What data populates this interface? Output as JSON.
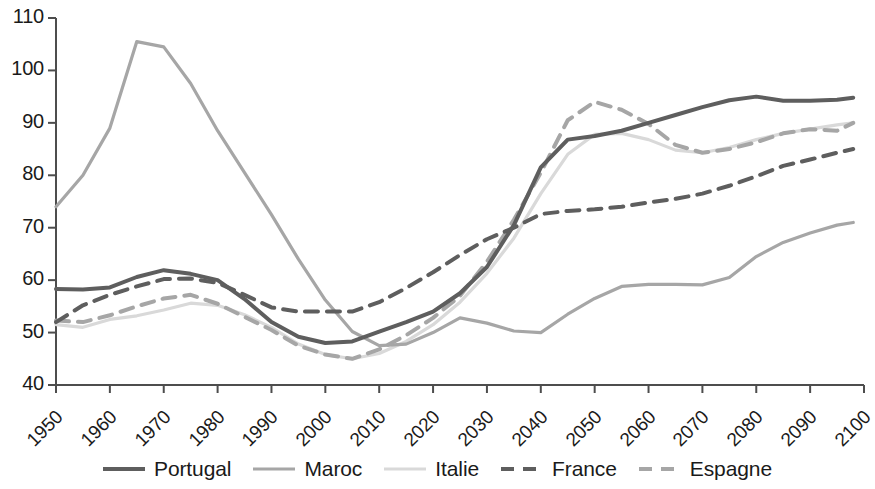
{
  "chart_data": {
    "type": "line",
    "title": "",
    "subtitle": "",
    "xlabel": "",
    "ylabel": "",
    "xlim": [
      1950,
      2100
    ],
    "ylim": [
      40,
      110
    ],
    "grid": false,
    "legend_position": "bottom",
    "x_ticks": [
      "1950",
      "1960",
      "1970",
      "1980",
      "1990",
      "2000",
      "2010",
      "2020",
      "2030",
      "2040",
      "2050",
      "2060",
      "2070",
      "2080",
      "2090",
      "2100"
    ],
    "y_ticks": [
      "40",
      "50",
      "60",
      "70",
      "80",
      "90",
      "100",
      "110"
    ],
    "x": [
      1950,
      1955,
      1960,
      1965,
      1970,
      1975,
      1980,
      1985,
      1990,
      1995,
      2000,
      2005,
      2010,
      2015,
      2020,
      2025,
      2030,
      2035,
      2040,
      2045,
      2050,
      2055,
      2060,
      2065,
      2070,
      2075,
      2080,
      2085,
      2090,
      2095,
      2098
    ],
    "series": [
      {
        "name": "Portugal",
        "color": "#5e5e5e",
        "style": "solid",
        "width": 4.0,
        "values": [
          58.3,
          58.2,
          58.6,
          60.6,
          61.9,
          61.2,
          60.0,
          56.4,
          52.0,
          49.2,
          48.0,
          48.3,
          50.2,
          52.0,
          54.0,
          57.5,
          62.5,
          70.5,
          81.5,
          86.8,
          87.5,
          88.5,
          90.0,
          91.5,
          93.0,
          94.3,
          95.0,
          94.2,
          94.2,
          94.4,
          94.8
        ]
      },
      {
        "name": "Maroc",
        "color": "#a6a6a6",
        "style": "solid",
        "width": 3.2,
        "values": [
          74.0,
          80.0,
          89.0,
          105.5,
          104.5,
          97.5,
          88.5,
          80.5,
          72.5,
          64.0,
          56.2,
          50.2,
          47.5,
          47.8,
          50.0,
          52.8,
          51.8,
          50.3,
          50.0,
          53.5,
          56.5,
          58.8,
          59.2,
          59.2,
          59.1,
          60.5,
          64.5,
          67.2,
          69.0,
          70.5,
          71.0
        ]
      },
      {
        "name": "Italie",
        "color": "#d9d9d9",
        "style": "solid",
        "width": 3.2,
        "values": [
          51.5,
          51.0,
          52.5,
          53.2,
          54.3,
          55.6,
          55.2,
          53.4,
          51.0,
          47.8,
          45.8,
          45.0,
          46.0,
          48.3,
          51.5,
          55.8,
          61.3,
          68.0,
          76.5,
          84.0,
          87.8,
          88.0,
          86.8,
          84.8,
          84.3,
          85.3,
          86.8,
          88.0,
          88.8,
          89.6,
          90.0
        ]
      },
      {
        "name": "France",
        "color": "#5e5e5e",
        "style": "dashed",
        "width": 4.0,
        "values": [
          52.0,
          55.2,
          57.2,
          58.8,
          60.2,
          60.3,
          59.5,
          57.2,
          54.8,
          54.0,
          54.0,
          54.0,
          55.8,
          58.5,
          61.5,
          64.8,
          67.8,
          70.0,
          72.6,
          73.2,
          73.5,
          74.0,
          74.8,
          75.5,
          76.5,
          78.0,
          79.8,
          81.8,
          83.0,
          84.3,
          85.0
        ]
      },
      {
        "name": "Espagne",
        "color": "#a6a6a6",
        "style": "dashed",
        "width": 4.0,
        "values": [
          52.3,
          52.0,
          53.3,
          55.0,
          56.5,
          57.2,
          55.5,
          53.0,
          50.5,
          47.5,
          45.8,
          45.0,
          46.8,
          49.5,
          52.8,
          57.0,
          63.5,
          71.5,
          80.5,
          90.5,
          94.0,
          92.5,
          89.8,
          85.8,
          84.3,
          85.0,
          86.3,
          88.0,
          88.8,
          88.5,
          90.0
        ]
      }
    ]
  },
  "legend": {
    "items": [
      {
        "label": "Portugal"
      },
      {
        "label": "Maroc"
      },
      {
        "label": "Italie"
      },
      {
        "label": "France"
      },
      {
        "label": "Espagne"
      }
    ]
  },
  "axis_color": "#4d4d4d"
}
